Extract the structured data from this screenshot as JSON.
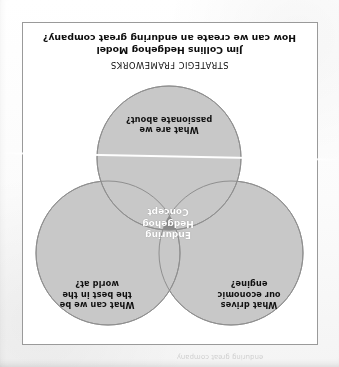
{
  "document": {
    "orientation": "rotated-180",
    "eyebrow": "STRATEGIC FRAMEWORKS",
    "title": "Jim Collins Hedgehog Model",
    "question": "How can we create an enduring great company?",
    "bleed_through_ghost": "enduring great company"
  },
  "diagram": {
    "type": "venn-3-circle",
    "core": {
      "label": "Enduring\nHedgehog\nConcept",
      "fill": "#8a8a8a",
      "text_color": "#ffffff"
    },
    "circles": [
      {
        "id": "economic-engine",
        "label": "What drives\nour economic\nengine?",
        "cx": 87,
        "cy": 92,
        "r": 72,
        "fill": "#c8c8c8",
        "stroke": "#8f8f8f"
      },
      {
        "id": "best-in-world",
        "label": "What can we be\nthe best in the\nworld at?",
        "cx": 210,
        "cy": 92,
        "r": 72,
        "fill": "#c8c8c8",
        "stroke": "#8f8f8f"
      },
      {
        "id": "passionate",
        "label": "What are we\npassionate about?",
        "cx": 149,
        "cy": 187,
        "r": 72,
        "fill": "#c8c8c8",
        "stroke": "#8f8f8f"
      }
    ]
  },
  "colors": {
    "circle_fill": "#c8c8c8",
    "circle_stroke": "#8f8f8f",
    "core_fill": "#8a8a8a",
    "frame_border": "#9a9a9a",
    "page_background": "#ffffff",
    "text": "#111111"
  }
}
